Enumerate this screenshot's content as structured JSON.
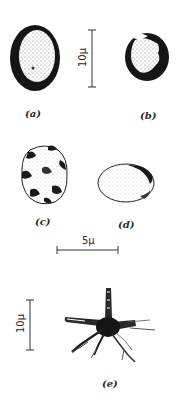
{
  "figure": {
    "panels": [
      {
        "id": "a",
        "label": "(a)",
        "description": "oval cell with thick dark wall and stippled interior"
      },
      {
        "id": "b",
        "label": "(b)",
        "description": "round cell with thick dark wall, partly open, stippled interior"
      },
      {
        "id": "c",
        "label": "(c)",
        "description": "lobed cell with dark patches"
      },
      {
        "id": "d",
        "label": "(d)",
        "description": "oval cell with thin wall, dark edges at upper right"
      },
      {
        "id": "e",
        "label": "(e)",
        "description": "star-shaped branched cell with radiating processes"
      }
    ],
    "scale_bars": [
      {
        "id": "scale-top",
        "text": "10μ",
        "orientation": "vertical"
      },
      {
        "id": "scale-middle",
        "text": "5μ",
        "orientation": "horizontal"
      },
      {
        "id": "scale-bottom",
        "text": "10μ",
        "orientation": "vertical"
      }
    ]
  },
  "colors": {
    "ink": "#1a1a1a",
    "background": "#ffffff",
    "stipple": "#9a9a9a"
  }
}
